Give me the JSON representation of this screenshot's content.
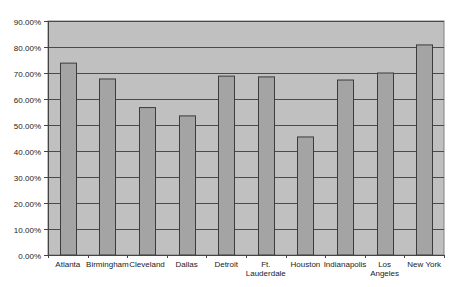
{
  "chart_data": {
    "type": "bar",
    "title": "",
    "xlabel": "",
    "ylabel": "",
    "categories": [
      "Atlanta",
      "Birmingham",
      "Cleveland",
      "Dallas",
      "Detroit",
      "Ft. Lauderdale",
      "Houston",
      "Indianapolis",
      "Los Angeles",
      "New York"
    ],
    "category_label_lines": [
      [
        "Atlanta"
      ],
      [
        "Birmingham"
      ],
      [
        "Cleveland"
      ],
      [
        "Dallas"
      ],
      [
        "Detroit"
      ],
      [
        "Ft.",
        "Lauderdale"
      ],
      [
        "Houston"
      ],
      [
        "Indianapolis"
      ],
      [
        "Los",
        "Angeles"
      ],
      [
        "New York"
      ]
    ],
    "values": [
      73.8,
      67.7,
      56.7,
      53.5,
      68.8,
      68.5,
      45.4,
      67.3,
      70.0,
      80.8
    ],
    "ylim": [
      0,
      90
    ],
    "yticks": [
      0,
      10,
      20,
      30,
      40,
      50,
      60,
      70,
      80,
      90
    ],
    "ytick_labels": [
      "0.00%",
      "10.00%",
      "20.00%",
      "30.00%",
      "40.00%",
      "50.00%",
      "60.00%",
      "70.00%",
      "80.00%",
      "90.00%"
    ],
    "grid": true,
    "legend": "none",
    "colors": {
      "plot_background": "#c0c0c0",
      "bar_fill": "#a4a4a4",
      "bar_stroke": "#3c3c3c",
      "gridline": "#4a4a4a"
    }
  }
}
